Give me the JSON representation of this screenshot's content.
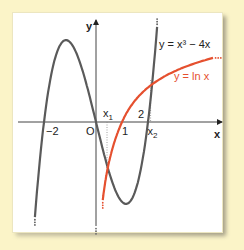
{
  "chart_data": {
    "type": "line",
    "title": "",
    "xlabel": "x",
    "ylabel": "y",
    "origin_label": "O",
    "xlim": [
      -3.2,
      4.8
    ],
    "ylim": [
      -3.4,
      3.7
    ],
    "grid": false,
    "x_tick_labels": [
      {
        "value": -2,
        "label": "−2"
      },
      {
        "value": 1,
        "label": "1"
      },
      {
        "value": 2,
        "label": "2"
      }
    ],
    "intersection_labels": [
      {
        "name": "x1",
        "label": "x",
        "sub": "1",
        "approx_x": 0.5
      },
      {
        "name": "x2",
        "label": "x",
        "sub": "2",
        "approx_x": 2.1
      }
    ],
    "series": [
      {
        "name": "cubic",
        "legend": "y = x³ − 4x",
        "equation": "x^3 - 4x",
        "color": "#5a5a5a",
        "x_range": [
          -2.35,
          2.35
        ]
      },
      {
        "name": "log",
        "legend": "y = ln x",
        "equation": "ln(x)",
        "color": "#e5502f",
        "x_range": [
          0.05,
          4.5
        ]
      }
    ]
  }
}
